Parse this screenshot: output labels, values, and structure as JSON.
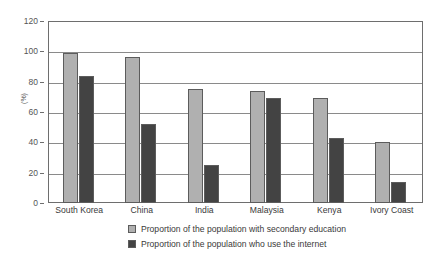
{
  "chart_data": {
    "type": "bar",
    "title": "",
    "subtitle": "",
    "xlabel": "",
    "ylabel": "(%)",
    "ylim": [
      0,
      120
    ],
    "ytick_step": 20,
    "yticks": [
      0,
      20,
      40,
      60,
      80,
      100,
      120
    ],
    "ytick_labels": [
      "0",
      "20",
      "40",
      "60",
      "80",
      "100",
      "120"
    ],
    "grid": true,
    "grid_axis": "y",
    "legend_position": "bottom",
    "categories": [
      "South Korea",
      "China",
      "India",
      "Malaysia",
      "Kenya",
      "Ivory Coast"
    ],
    "series": [
      {
        "name": "Proportion of the population with secondary education",
        "color": "#b0b0b0",
        "values": [
          99,
          96,
          75,
          74,
          69,
          40
        ]
      },
      {
        "name": "Proportion of the population who use the internet",
        "color": "#434343",
        "values": [
          84,
          52,
          25,
          69,
          43,
          14
        ]
      }
    ]
  },
  "figure": {
    "border_color": "#6e6e6e",
    "gridline_color": "#8a8a8a",
    "background": "#ffffff"
  }
}
